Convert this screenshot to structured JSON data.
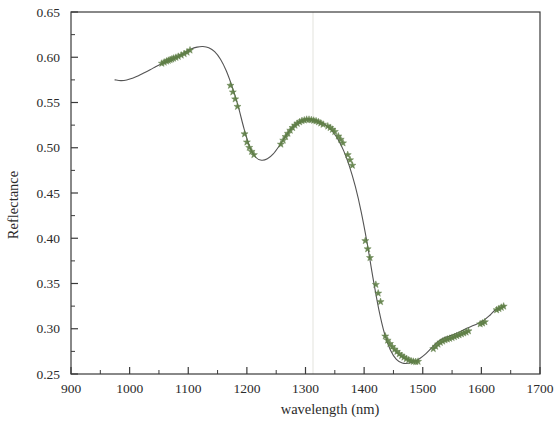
{
  "figure": {
    "background_color": "#ffffff",
    "frame_color": "#3a3a3a",
    "tick_label_color": "#2b2b2b"
  },
  "chart_data": {
    "type": "line",
    "title": "",
    "subtitle": "",
    "xlabel": "wavelength (nm)",
    "ylabel": "Reflectance",
    "xlim": [
      900,
      1700
    ],
    "ylim": [
      0.25,
      0.65
    ],
    "grid": false,
    "legend": null,
    "legend_position": "none",
    "x_major_ticks": [
      900,
      1000,
      1100,
      1200,
      1300,
      1400,
      1500,
      1600,
      1700
    ],
    "x_tick_labels": [
      "900",
      "1000",
      "1100",
      "1200",
      "1300",
      "1400",
      "1500",
      "1600",
      "1700"
    ],
    "x_minor_tick_step": 50,
    "y_major_ticks": [
      0.25,
      0.3,
      0.35,
      0.4,
      0.45,
      0.5,
      0.55,
      0.6,
      0.65
    ],
    "y_tick_labels": [
      "0.25",
      "0.30",
      "0.35",
      "0.40",
      "0.45",
      "0.50",
      "0.55",
      "0.60",
      "0.65"
    ],
    "y_minor_tick_step": 0.025,
    "series": [
      {
        "name": "reflectance-spectrum",
        "type": "line",
        "line_color": "#545454",
        "line_width": 1.1,
        "x": [
          975,
          985,
          995,
          1005,
          1015,
          1025,
          1035,
          1045,
          1055,
          1065,
          1075,
          1085,
          1095,
          1105,
          1115,
          1125,
          1135,
          1145,
          1155,
          1165,
          1175,
          1185,
          1195,
          1205,
          1215,
          1225,
          1235,
          1245,
          1255,
          1265,
          1275,
          1285,
          1295,
          1305,
          1315,
          1325,
          1335,
          1345,
          1355,
          1365,
          1375,
          1385,
          1395,
          1405,
          1415,
          1425,
          1435,
          1445,
          1455,
          1465,
          1475,
          1485,
          1495,
          1505,
          1515,
          1525,
          1535,
          1545,
          1555,
          1565,
          1575,
          1585,
          1595,
          1605,
          1615,
          1625,
          1640
        ],
        "y": [
          0.575,
          0.5742,
          0.5748,
          0.5768,
          0.5795,
          0.5828,
          0.5862,
          0.5898,
          0.5932,
          0.5962,
          0.5988,
          0.6018,
          0.6055,
          0.6092,
          0.6112,
          0.6118,
          0.6105,
          0.6062,
          0.5978,
          0.5848,
          0.5672,
          0.5462,
          0.5215,
          0.5005,
          0.4895,
          0.4862,
          0.4878,
          0.4932,
          0.5018,
          0.5118,
          0.5208,
          0.5272,
          0.5302,
          0.5312,
          0.5305,
          0.5285,
          0.5248,
          0.5188,
          0.5098,
          0.4968,
          0.4795,
          0.4572,
          0.4292,
          0.3952,
          0.3565,
          0.3215,
          0.2942,
          0.2762,
          0.2662,
          0.2622,
          0.2618,
          0.2638,
          0.2672,
          0.2722,
          0.2788,
          0.2852,
          0.2895,
          0.2918,
          0.2942,
          0.2972,
          0.3005,
          0.3032,
          0.3062,
          0.3098,
          0.3152,
          0.3212,
          0.3252
        ]
      }
    ],
    "markers": {
      "symbol": "star",
      "color": "#5f7f46",
      "size": 6,
      "x": [
        1055,
        1059,
        1063,
        1066,
        1069,
        1072,
        1075,
        1079,
        1083,
        1088,
        1093,
        1098,
        1103,
        1172,
        1176,
        1180,
        1184,
        1196,
        1200,
        1204,
        1208,
        1212,
        1258,
        1262,
        1266,
        1270,
        1274,
        1278,
        1282,
        1286,
        1290,
        1294,
        1298,
        1302,
        1306,
        1310,
        1314,
        1318,
        1322,
        1326,
        1330,
        1338,
        1342,
        1346,
        1350,
        1356,
        1360,
        1364,
        1372,
        1376,
        1380,
        1402,
        1406,
        1410,
        1420,
        1424,
        1428,
        1436,
        1440,
        1444,
        1448,
        1452,
        1456,
        1460,
        1464,
        1468,
        1472,
        1476,
        1480,
        1484,
        1488,
        1492,
        1518,
        1522,
        1526,
        1530,
        1534,
        1538,
        1542,
        1546,
        1550,
        1554,
        1558,
        1562,
        1566,
        1570,
        1574,
        1578,
        1598,
        1602,
        1606,
        1626,
        1630,
        1634,
        1638
      ],
      "y": [
        0.5932,
        0.5944,
        0.5956,
        0.5964,
        0.5972,
        0.5979,
        0.5988,
        0.5997,
        0.6008,
        0.6022,
        0.6038,
        0.6055,
        0.6078,
        0.5688,
        0.5615,
        0.5538,
        0.5455,
        0.5152,
        0.5062,
        0.5002,
        0.4958,
        0.4922,
        0.5038,
        0.5082,
        0.5122,
        0.5158,
        0.5192,
        0.5222,
        0.5248,
        0.5268,
        0.5285,
        0.5298,
        0.5305,
        0.5312,
        0.5312,
        0.5308,
        0.5302,
        0.5295,
        0.5285,
        0.5272,
        0.5258,
        0.5238,
        0.5222,
        0.5202,
        0.5178,
        0.5128,
        0.5092,
        0.5052,
        0.4922,
        0.4865,
        0.4805,
        0.3972,
        0.3882,
        0.3785,
        0.3488,
        0.3392,
        0.3298,
        0.2918,
        0.2872,
        0.2835,
        0.2802,
        0.2772,
        0.2748,
        0.2722,
        0.2702,
        0.2685,
        0.2668,
        0.2655,
        0.2645,
        0.2638,
        0.2635,
        0.2638,
        0.2778,
        0.2805,
        0.2828,
        0.2848,
        0.2862,
        0.2875,
        0.2885,
        0.2892,
        0.2902,
        0.2912,
        0.2922,
        0.2932,
        0.2942,
        0.2952,
        0.2962,
        0.2975,
        0.3052,
        0.3062,
        0.3075,
        0.3208,
        0.3222,
        0.3235,
        0.3248
      ]
    },
    "annotations": []
  }
}
